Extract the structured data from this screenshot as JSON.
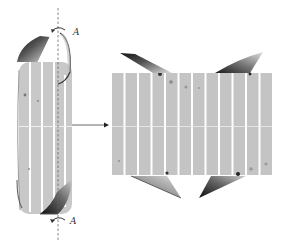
{
  "figure": {
    "left_cylinder": {
      "axis_label_top": "A",
      "axis_label_bottom": "A",
      "stripe_count": 5
    },
    "arrow": {
      "direction": "right"
    },
    "right_panel": {
      "stripe_count": 12
    },
    "colors": {
      "stripe_fill": "#c4c4c4",
      "gap": "#ffffff",
      "flap_dark": "#1e1e1e",
      "flap_mid": "#8a8a8a",
      "flap_light": "#d8d8d8",
      "axis_line": "#666666",
      "arrow": "#444444"
    }
  }
}
